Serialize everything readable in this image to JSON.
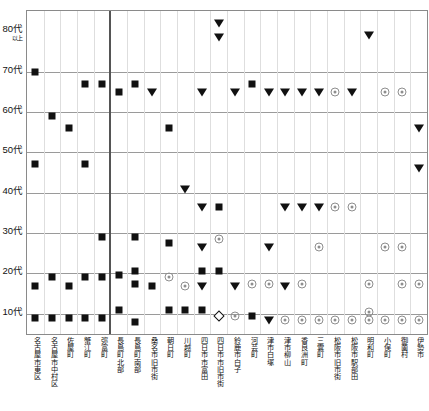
{
  "chart_data": {
    "type": "scatter",
    "title": "",
    "xlabel": "",
    "ylabel": "",
    "grid": true,
    "legend": null,
    "y_categories": [
      "10代",
      "20代",
      "30代",
      "40代",
      "50代",
      "60代",
      "70代",
      "80代以上"
    ],
    "y_tick_labels": [
      {
        "main": "80代",
        "sub": "以上"
      },
      {
        "main": "70代",
        "sub": ""
      },
      {
        "main": "60代",
        "sub": ""
      },
      {
        "main": "50代",
        "sub": ""
      },
      {
        "main": "40代",
        "sub": ""
      },
      {
        "main": "30代",
        "sub": ""
      },
      {
        "main": "20代",
        "sub": ""
      },
      {
        "main": "10代",
        "sub": ""
      }
    ],
    "categories": [
      "名古屋市東区",
      "名古屋市中村区",
      "佐屋町",
      "蟹江町",
      "弥富町",
      "長島町北部",
      "長島町南部",
      "桑名市旧市街",
      "朝日町",
      "川越町",
      "四日市市富田",
      "四日市市旧市街",
      "鈴鹿市白子",
      "河芸町",
      "津市白塚",
      "津市柳山",
      "香良洲町",
      "三雲町",
      "松阪市旧市街",
      "松阪市駅部田",
      "明和町",
      "小俣町",
      "御薗村",
      "伊勢市"
    ],
    "marker_types": {
      "sq": "filled-square",
      "tri": "filled-down-triangle",
      "circ": "open-target-circle",
      "dia": "open-diamond"
    },
    "points": [
      {
        "c": 0,
        "y": 70.0,
        "m": "sq"
      },
      {
        "c": 0,
        "y": 47.0,
        "m": "sq"
      },
      {
        "c": 0,
        "y": 17.0,
        "m": "sq"
      },
      {
        "c": 0,
        "y": 9.0,
        "m": "sq"
      },
      {
        "c": 1,
        "y": 59.0,
        "m": "sq"
      },
      {
        "c": 1,
        "y": 19.0,
        "m": "sq"
      },
      {
        "c": 1,
        "y": 9.0,
        "m": "sq"
      },
      {
        "c": 2,
        "y": 56.0,
        "m": "sq"
      },
      {
        "c": 2,
        "y": 17.0,
        "m": "sq"
      },
      {
        "c": 2,
        "y": 9.0,
        "m": "sq"
      },
      {
        "c": 3,
        "y": 67.0,
        "m": "sq"
      },
      {
        "c": 3,
        "y": 47.0,
        "m": "sq"
      },
      {
        "c": 3,
        "y": 19.0,
        "m": "sq"
      },
      {
        "c": 3,
        "y": 9.0,
        "m": "sq"
      },
      {
        "c": 4,
        "y": 67.0,
        "m": "sq"
      },
      {
        "c": 4,
        "y": 29.0,
        "m": "sq"
      },
      {
        "c": 4,
        "y": 19.0,
        "m": "sq"
      },
      {
        "c": 4,
        "y": 9.0,
        "m": "sq"
      },
      {
        "c": 5,
        "y": 65.0,
        "m": "sq"
      },
      {
        "c": 5,
        "y": 19.5,
        "m": "sq"
      },
      {
        "c": 5,
        "y": 11.0,
        "m": "sq"
      },
      {
        "c": 6,
        "y": 67.0,
        "m": "sq"
      },
      {
        "c": 6,
        "y": 29.0,
        "m": "sq"
      },
      {
        "c": 6,
        "y": 20.5,
        "m": "sq"
      },
      {
        "c": 6,
        "y": 17.5,
        "m": "sq"
      },
      {
        "c": 6,
        "y": 8.0,
        "m": "sq"
      },
      {
        "c": 7,
        "y": 65.0,
        "m": "tri"
      },
      {
        "c": 7,
        "y": 17.0,
        "m": "sq"
      },
      {
        "c": 8,
        "y": 56.0,
        "m": "sq"
      },
      {
        "c": 8,
        "y": 27.5,
        "m": "sq"
      },
      {
        "c": 8,
        "y": 19.0,
        "m": "circ"
      },
      {
        "c": 8,
        "y": 11.0,
        "m": "sq"
      },
      {
        "c": 9,
        "y": 41.0,
        "m": "tri"
      },
      {
        "c": 9,
        "y": 17.0,
        "m": "circ"
      },
      {
        "c": 9,
        "y": 11.0,
        "m": "sq"
      },
      {
        "c": 10,
        "y": 65.0,
        "m": "tri"
      },
      {
        "c": 10,
        "y": 36.5,
        "m": "tri"
      },
      {
        "c": 10,
        "y": 26.5,
        "m": "tri"
      },
      {
        "c": 10,
        "y": 20.5,
        "m": "sq"
      },
      {
        "c": 10,
        "y": 17.0,
        "m": "tri"
      },
      {
        "c": 10,
        "y": 11.0,
        "m": "sq"
      },
      {
        "c": 11,
        "y": 82.0,
        "m": "tri"
      },
      {
        "c": 11,
        "y": 78.5,
        "m": "tri"
      },
      {
        "c": 11,
        "y": 36.5,
        "m": "sq"
      },
      {
        "c": 11,
        "y": 28.5,
        "m": "circ"
      },
      {
        "c": 11,
        "y": 20.5,
        "m": "sq"
      },
      {
        "c": 11,
        "y": 9.5,
        "m": "dia"
      },
      {
        "c": 12,
        "y": 65.0,
        "m": "tri"
      },
      {
        "c": 12,
        "y": 17.0,
        "m": "tri"
      },
      {
        "c": 12,
        "y": 9.5,
        "m": "circ"
      },
      {
        "c": 13,
        "y": 67.0,
        "m": "sq"
      },
      {
        "c": 13,
        "y": 17.5,
        "m": "circ"
      },
      {
        "c": 13,
        "y": 9.5,
        "m": "sq"
      },
      {
        "c": 14,
        "y": 65.0,
        "m": "tri"
      },
      {
        "c": 14,
        "y": 26.5,
        "m": "tri"
      },
      {
        "c": 14,
        "y": 17.5,
        "m": "circ"
      },
      {
        "c": 14,
        "y": 8.5,
        "m": "tri"
      },
      {
        "c": 15,
        "y": 65.0,
        "m": "tri"
      },
      {
        "c": 15,
        "y": 36.5,
        "m": "tri"
      },
      {
        "c": 15,
        "y": 17.0,
        "m": "tri"
      },
      {
        "c": 15,
        "y": 8.5,
        "m": "circ"
      },
      {
        "c": 16,
        "y": 65.0,
        "m": "tri"
      },
      {
        "c": 16,
        "y": 36.5,
        "m": "tri"
      },
      {
        "c": 16,
        "y": 17.5,
        "m": "circ"
      },
      {
        "c": 16,
        "y": 8.5,
        "m": "circ"
      },
      {
        "c": 17,
        "y": 65.0,
        "m": "tri"
      },
      {
        "c": 17,
        "y": 36.5,
        "m": "tri"
      },
      {
        "c": 17,
        "y": 26.5,
        "m": "circ"
      },
      {
        "c": 17,
        "y": 8.5,
        "m": "circ"
      },
      {
        "c": 18,
        "y": 65.0,
        "m": "circ"
      },
      {
        "c": 18,
        "y": 36.5,
        "m": "circ"
      },
      {
        "c": 18,
        "y": 8.5,
        "m": "circ"
      },
      {
        "c": 19,
        "y": 65.0,
        "m": "tri"
      },
      {
        "c": 19,
        "y": 36.5,
        "m": "circ"
      },
      {
        "c": 19,
        "y": 8.5,
        "m": "circ"
      },
      {
        "c": 20,
        "y": 79.0,
        "m": "tri"
      },
      {
        "c": 20,
        "y": 17.5,
        "m": "circ"
      },
      {
        "c": 20,
        "y": 10.5,
        "m": "circ"
      },
      {
        "c": 20,
        "y": 8.5,
        "m": "circ"
      },
      {
        "c": 21,
        "y": 65.0,
        "m": "circ"
      },
      {
        "c": 21,
        "y": 26.5,
        "m": "circ"
      },
      {
        "c": 21,
        "y": 8.5,
        "m": "circ"
      },
      {
        "c": 22,
        "y": 65.0,
        "m": "circ"
      },
      {
        "c": 22,
        "y": 26.5,
        "m": "circ"
      },
      {
        "c": 22,
        "y": 17.5,
        "m": "circ"
      },
      {
        "c": 22,
        "y": 8.5,
        "m": "circ"
      },
      {
        "c": 23,
        "y": 56.0,
        "m": "tri"
      },
      {
        "c": 23,
        "y": 46.0,
        "m": "tri"
      },
      {
        "c": 23,
        "y": 17.5,
        "m": "circ"
      },
      {
        "c": 23,
        "y": 8.5,
        "m": "circ"
      }
    ],
    "separator_after_category_index": 4,
    "axis": {
      "ymin": 5,
      "ymax": 85,
      "tick_values": [
        80,
        70,
        60,
        50,
        40,
        30,
        20,
        10
      ]
    }
  }
}
